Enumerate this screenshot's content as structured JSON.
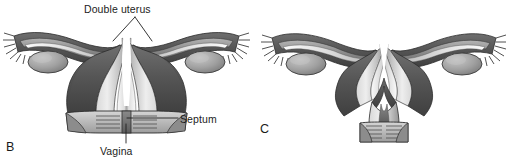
{
  "figure": {
    "kind": "medical-illustration",
    "background_color": "#ffffff"
  },
  "labels": {
    "double_uterus": "Double uterus",
    "septum": "Septum",
    "vagina": "Vagina"
  },
  "panels": [
    {
      "letter": "B",
      "name": "didelphys-double-uterus",
      "callouts": [
        "Double uterus",
        "Septum",
        "Vagina"
      ]
    },
    {
      "letter": "C",
      "name": "bicornuate-uterus",
      "callouts": []
    }
  ],
  "colors": {
    "ink": "#1c1c1c",
    "outline": "#2b2b2b",
    "serosa_dark": "#5e5e5e",
    "myometrium_mid": "#8d8d8d",
    "lumen_light": "#e2e2e2",
    "highlight": "#f4f4f4",
    "ovary": "#9a9a9a",
    "shadow": "#4a4a4a",
    "leader_line": "#1f1f1f"
  },
  "anatomy": {
    "structures": [
      "fallopian tube",
      "fimbriae",
      "ovary",
      "uterine horn",
      "uterine cavity",
      "cervix",
      "vagina",
      "vaginal septum"
    ]
  }
}
